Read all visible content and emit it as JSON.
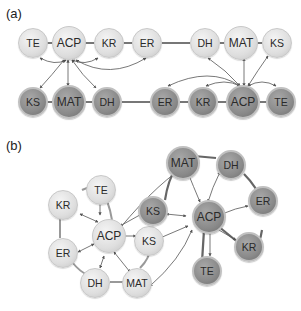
{
  "panels": {
    "a": {
      "label": "(a)"
    },
    "b": {
      "label": "(b)"
    }
  },
  "colors": {
    "light_node": "#dedede",
    "dark_node": "#8a8a8a",
    "edge": "#777777",
    "arrow": "#555555"
  },
  "diagram_a": {
    "top_row": [
      "TE",
      "ACP",
      "KR",
      "ER",
      "DH",
      "MAT",
      "KS"
    ],
    "bottom_row": [
      "KS",
      "MAT",
      "DH",
      "ER",
      "KR",
      "ACP",
      "TE"
    ]
  },
  "diagram_b": {
    "light_cluster": [
      "TE",
      "KR",
      "ACP",
      "ER",
      "DH",
      "MAT",
      "KS"
    ],
    "dark_cluster": [
      "MAT",
      "DH",
      "KS",
      "ACP",
      "ER",
      "KR",
      "TE"
    ]
  }
}
